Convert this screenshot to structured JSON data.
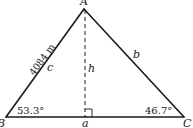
{
  "diagram": {
    "type": "triangle-with-altitude",
    "vertices": {
      "A": {
        "label": "A",
        "x": 84,
        "y": 9
      },
      "B": {
        "label": "B",
        "x": 6,
        "y": 117
      },
      "C": {
        "label": "C",
        "x": 184,
        "y": 117
      }
    },
    "altitude_foot": {
      "x": 85,
      "y": 117
    },
    "sides": {
      "a": {
        "label": "a"
      },
      "b": {
        "label": "b"
      },
      "c": {
        "label": "c",
        "length": "4084 m"
      }
    },
    "altitude": {
      "label": "h"
    },
    "angles": {
      "B": {
        "value": "53.3°"
      },
      "C": {
        "value": "46.7°"
      }
    },
    "right_angle_marker": true,
    "colors": {
      "stroke": "#1a1a1a",
      "background": "#ffffff"
    }
  }
}
